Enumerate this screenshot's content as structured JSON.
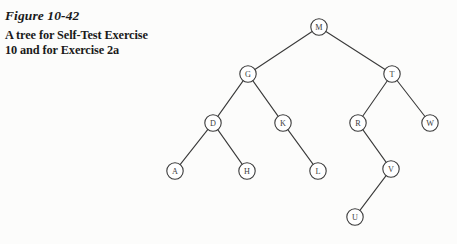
{
  "figure": {
    "number_label": "Figure 10-42",
    "caption_line_1": "A tree for Self-Test Exercise",
    "caption_line_2": "10 and for Exercise 2a"
  },
  "colors": {
    "background": "#fcfcfb",
    "node_stroke": "#3a3a3a",
    "node_fill": "#ffffff",
    "edge_stroke": "#3a3a3a",
    "text": "#1a1a1a",
    "label_text": "#3d3d3d"
  },
  "tree": {
    "root": "M",
    "node_radius": 8.2,
    "nodes": [
      {
        "id": "M",
        "label": "M",
        "x": 319,
        "y": 27
      },
      {
        "id": "G",
        "label": "G",
        "x": 248,
        "y": 74
      },
      {
        "id": "T",
        "label": "T",
        "x": 392,
        "y": 74
      },
      {
        "id": "D",
        "label": "D",
        "x": 213,
        "y": 123
      },
      {
        "id": "K",
        "label": "K",
        "x": 283,
        "y": 123
      },
      {
        "id": "R",
        "label": "R",
        "x": 358,
        "y": 123
      },
      {
        "id": "W",
        "label": "W",
        "x": 430,
        "y": 123
      },
      {
        "id": "A",
        "label": "A",
        "x": 175,
        "y": 171
      },
      {
        "id": "H",
        "label": "H",
        "x": 247,
        "y": 171
      },
      {
        "id": "L",
        "label": "L",
        "x": 318,
        "y": 171
      },
      {
        "id": "V",
        "label": "V",
        "x": 391,
        "y": 169
      },
      {
        "id": "U",
        "label": "U",
        "x": 355,
        "y": 217
      }
    ],
    "edges": [
      {
        "from": "M",
        "to": "G"
      },
      {
        "from": "M",
        "to": "T"
      },
      {
        "from": "G",
        "to": "D"
      },
      {
        "from": "G",
        "to": "K"
      },
      {
        "from": "T",
        "to": "R"
      },
      {
        "from": "T",
        "to": "W"
      },
      {
        "from": "D",
        "to": "A"
      },
      {
        "from": "D",
        "to": "H"
      },
      {
        "from": "K",
        "to": "L"
      },
      {
        "from": "R",
        "to": "V"
      },
      {
        "from": "V",
        "to": "U"
      }
    ]
  }
}
